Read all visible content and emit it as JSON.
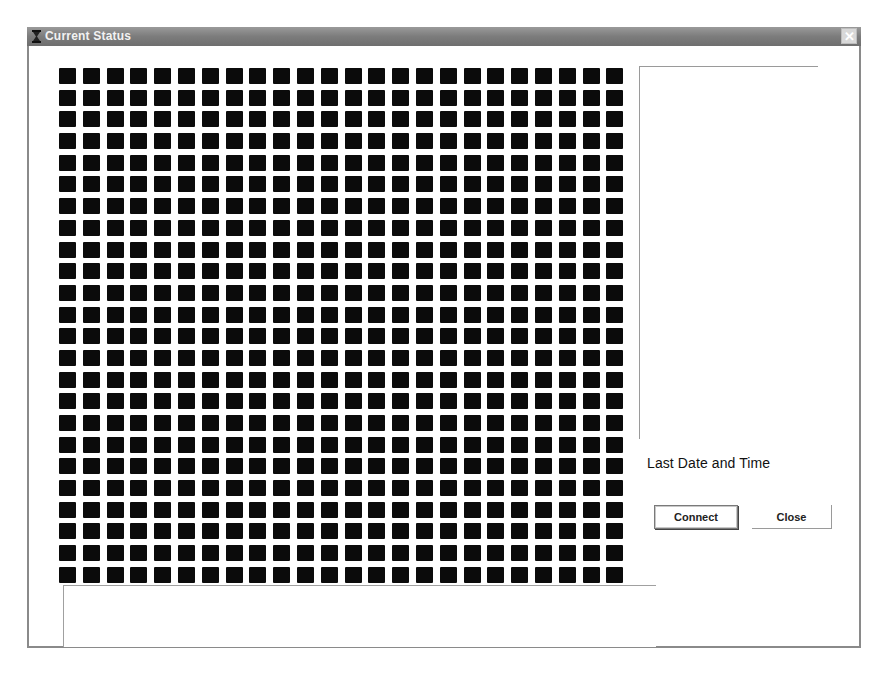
{
  "window": {
    "title": "Current Status",
    "title_icon": "hourglass-icon",
    "close_glyph": "✕"
  },
  "grid": {
    "rows": 24,
    "columns": 24,
    "cell_color": "#0b0b0b",
    "cell_count": 576
  },
  "side_panel": {
    "content": ""
  },
  "status": {
    "last_date_label": "Last Date and Time"
  },
  "buttons": {
    "connect_label": "Connect",
    "close_label": "Close"
  },
  "log": {
    "content": ""
  }
}
